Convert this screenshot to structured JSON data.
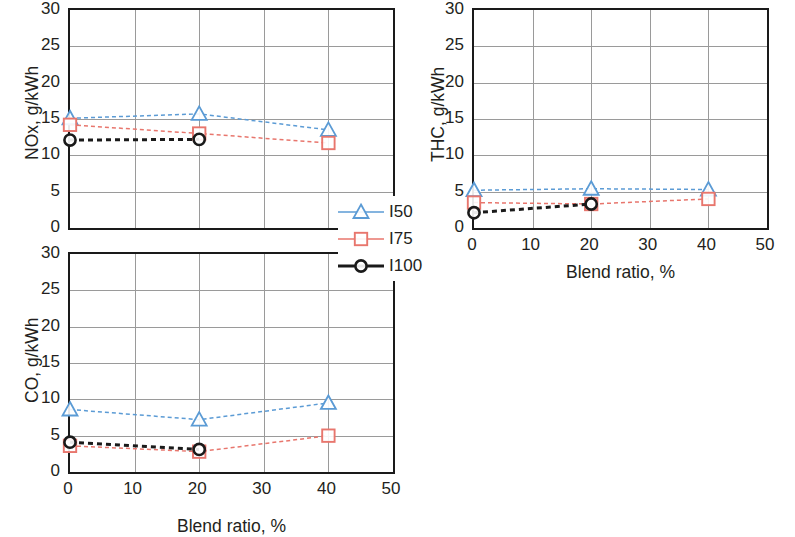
{
  "figure": {
    "series_names": [
      "I50",
      "I75",
      "I100"
    ],
    "colors": {
      "I50": "#5b9bd5",
      "I75": "#e8766d",
      "I100": "#1a1a1a",
      "grid": "#9a9a9a",
      "axis": "#1a1a1a",
      "text": "#231f20"
    }
  },
  "legend": {
    "items": [
      {
        "label": "I50",
        "marker": "triangle-open",
        "color": "#5b9bd5"
      },
      {
        "label": "I75",
        "marker": "square-open",
        "color": "#e8766d"
      },
      {
        "label": "I100",
        "marker": "circle-open",
        "color": "#1a1a1a"
      }
    ]
  },
  "chart_data": [
    {
      "id": "nox",
      "type": "line",
      "title": "",
      "xlabel": "",
      "ylabel": "NOx, g/kWh",
      "x": [
        0,
        20,
        40
      ],
      "xlim": [
        0,
        50
      ],
      "ylim": [
        0,
        30
      ],
      "xticks": [
        0,
        10,
        20,
        30,
        40,
        50
      ],
      "xticklabels": [
        "",
        "",
        "",
        "",
        "",
        ""
      ],
      "yticks": [
        0,
        5,
        10,
        15,
        20,
        25,
        30
      ],
      "yticklabels": [
        "0",
        "5",
        "10",
        "15",
        "20",
        "25",
        "30"
      ],
      "grid": true,
      "legend_position": "outside-right",
      "series": [
        {
          "name": "I50",
          "values": [
            15.1,
            15.7,
            13.5
          ],
          "color": "#5b9bd5",
          "marker": "triangle-open",
          "linestyle": "dashed"
        },
        {
          "name": "I75",
          "values": [
            14.2,
            13.0,
            11.7
          ],
          "color": "#e8766d",
          "marker": "square-open",
          "linestyle": "dashed"
        },
        {
          "name": "I100",
          "values": [
            12.1,
            12.2,
            null
          ],
          "color": "#1a1a1a",
          "marker": "circle-open",
          "linestyle": "dashed"
        }
      ]
    },
    {
      "id": "thc",
      "type": "line",
      "title": "",
      "xlabel": "Blend ratio, %",
      "ylabel": "THC, g/kWh",
      "x": [
        0,
        20,
        40
      ],
      "xlim": [
        0,
        50
      ],
      "ylim": [
        0,
        30
      ],
      "xticks": [
        0,
        10,
        20,
        30,
        40,
        50
      ],
      "xticklabels": [
        "0",
        "10",
        "20",
        "30",
        "40",
        "50"
      ],
      "yticks": [
        0,
        5,
        10,
        15,
        20,
        25,
        30
      ],
      "yticklabels": [
        "0",
        "5",
        "10",
        "15",
        "20",
        "25",
        "30"
      ],
      "grid": true,
      "legend_position": "none",
      "series": [
        {
          "name": "I50",
          "values": [
            5.2,
            5.4,
            5.3
          ],
          "color": "#5b9bd5",
          "marker": "triangle-open",
          "linestyle": "dashed"
        },
        {
          "name": "I75",
          "values": [
            3.5,
            3.3,
            4.0
          ],
          "color": "#e8766d",
          "marker": "square-open",
          "linestyle": "dashed"
        },
        {
          "name": "I100",
          "values": [
            2.1,
            3.3,
            null
          ],
          "color": "#1a1a1a",
          "marker": "circle-open",
          "linestyle": "dashed"
        }
      ]
    },
    {
      "id": "co",
      "type": "line",
      "title": "",
      "xlabel": "Blend ratio, %",
      "ylabel": "CO, g/kWh",
      "x": [
        0,
        20,
        40
      ],
      "xlim": [
        0,
        50
      ],
      "ylim": [
        0,
        30
      ],
      "xticks": [
        0,
        10,
        20,
        30,
        40,
        50
      ],
      "xticklabels": [
        "0",
        "10",
        "20",
        "30",
        "40",
        "50"
      ],
      "yticks": [
        0,
        5,
        10,
        15,
        20,
        25,
        30
      ],
      "yticklabels": [
        "0",
        "5",
        "10",
        "15",
        "20",
        "25",
        "30"
      ],
      "grid": true,
      "legend_position": "none",
      "series": [
        {
          "name": "I50",
          "values": [
            8.6,
            7.2,
            9.5
          ],
          "color": "#5b9bd5",
          "marker": "triangle-open",
          "linestyle": "dashed"
        },
        {
          "name": "I75",
          "values": [
            3.6,
            2.8,
            5.0
          ],
          "color": "#e8766d",
          "marker": "square-open",
          "linestyle": "dashed"
        },
        {
          "name": "I100",
          "values": [
            4.1,
            3.1,
            null
          ],
          "color": "#1a1a1a",
          "marker": "circle-open",
          "linestyle": "dashed"
        }
      ]
    }
  ]
}
